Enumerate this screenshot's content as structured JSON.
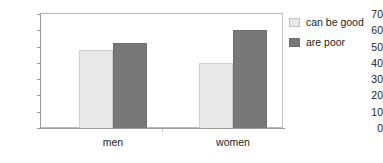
{
  "chart_data": {
    "type": "bar",
    "title": "",
    "subtitle": "",
    "xlabel": "",
    "ylabel": "",
    "categories": [
      "men",
      "women"
    ],
    "series": [
      {
        "name": "can be good",
        "values": [
          48,
          40
        ],
        "color": "#e8e8e8"
      },
      {
        "name": "are poor",
        "values": [
          52,
          60
        ],
        "color": "#787878"
      }
    ],
    "ylim": [
      0,
      70
    ],
    "ytick_step": 10,
    "yticks": [
      70,
      60,
      50,
      40,
      30,
      20,
      10,
      0
    ],
    "grid": true,
    "grid_axis": "y",
    "legend_position": "right",
    "annotations": []
  },
  "axes": {
    "y_tick_labels": [
      "70",
      "60",
      "50",
      "40",
      "30",
      "20",
      "10",
      "0"
    ],
    "x_tick_labels": [
      "men",
      "women"
    ]
  },
  "legend": {
    "items": [
      {
        "label": "can be good",
        "swatch": "light-gray-swatch-icon"
      },
      {
        "label": "are poor",
        "swatch": "dark-gray-swatch-icon"
      }
    ]
  },
  "colors": {
    "series_light": "#e8e8e8",
    "series_dark": "#787878",
    "gridline": "#c9c9c9",
    "axis": "#9a9a9a",
    "text": "#1d1d1d",
    "background": "#ffffff"
  }
}
